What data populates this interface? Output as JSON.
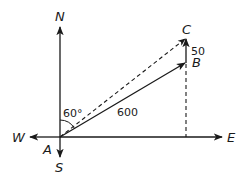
{
  "diagram": {
    "type": "vector-navigation",
    "colors": {
      "stroke": "#1a1a1a",
      "background": "#ffffff"
    },
    "compass": {
      "north": "N",
      "south": "S",
      "east": "E",
      "west": "W"
    },
    "points": {
      "origin": "A",
      "end_solid": "B",
      "end_resultant": "C"
    },
    "labels": {
      "angle": "60°",
      "magnitude_AB": "600",
      "magnitude_BC": "50"
    },
    "vectors": [
      {
        "from": "A",
        "to": "B",
        "style": "solid",
        "magnitude": "600",
        "bearing": "60° from north"
      },
      {
        "from": "B",
        "to": "C",
        "style": "solid",
        "magnitude": "50",
        "direction": "north"
      },
      {
        "from": "A",
        "to": "C",
        "style": "dashed",
        "role": "resultant"
      }
    ]
  }
}
